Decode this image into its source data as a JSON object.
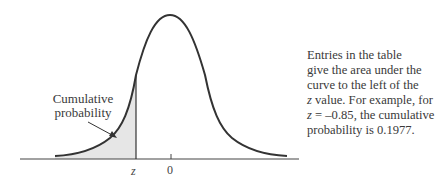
{
  "diagram": {
    "type": "standard-normal-curve",
    "shaded_region": "left tail up to z",
    "labels": {
      "region": "Cumulative probability",
      "z_marker": "z",
      "zero_marker": "0"
    },
    "colors": {
      "curve": "#333333",
      "shade": "#e6e6e6",
      "axis": "#444444"
    }
  },
  "description": {
    "line1": "Entries in the table",
    "line2": "give the area under the",
    "line3": "curve to the left of the",
    "line4_var": "z",
    "line4_rest": " value. For example, for",
    "line5_var": "z",
    "line5_rest": " = –0.85, the cumulative",
    "line6": "probability is 0.1977."
  }
}
